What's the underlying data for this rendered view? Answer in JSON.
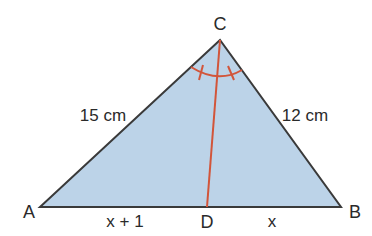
{
  "diagram": {
    "type": "triangle-angle-bisector",
    "colors": {
      "fill": "#bcd3e8",
      "outline": "#3a3a3a",
      "bisector": "#d2553a",
      "text": "#2a2a2a",
      "background": "#ffffff"
    },
    "vertices": {
      "A": {
        "label": "A",
        "x": 40,
        "y": 207
      },
      "B": {
        "label": "B",
        "x": 341,
        "y": 207
      },
      "C": {
        "label": "C",
        "x": 220,
        "y": 40
      },
      "D": {
        "label": "D",
        "x": 207,
        "y": 207
      }
    },
    "sides": {
      "AC": {
        "label": "15 cm"
      },
      "BC": {
        "label": "12 cm"
      },
      "AD": {
        "label": "x + 1"
      },
      "DB": {
        "label": "x"
      }
    },
    "angle_marks": {
      "vertex": "C",
      "equal_angles": 2,
      "description": "Arc at C with tick marks showing CD bisects angle ACB"
    }
  }
}
